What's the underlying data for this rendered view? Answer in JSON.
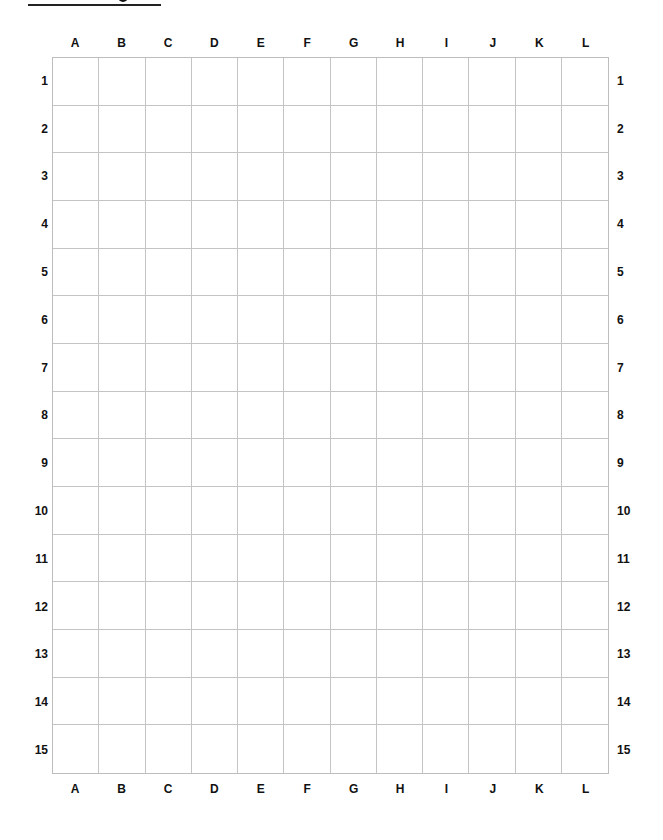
{
  "document": {
    "title_visible": "",
    "title_note": "title text cut off above frame; only underline visible"
  },
  "grid": {
    "columns": [
      "A",
      "B",
      "C",
      "D",
      "E",
      "F",
      "G",
      "H",
      "I",
      "J",
      "K",
      "L"
    ],
    "rows": [
      "1",
      "2",
      "3",
      "4",
      "5",
      "6",
      "7",
      "8",
      "9",
      "10",
      "11",
      "12",
      "13",
      "14",
      "15"
    ],
    "cells_filled": false,
    "line_color": "#c4c4c4",
    "label_color": "#111111"
  }
}
